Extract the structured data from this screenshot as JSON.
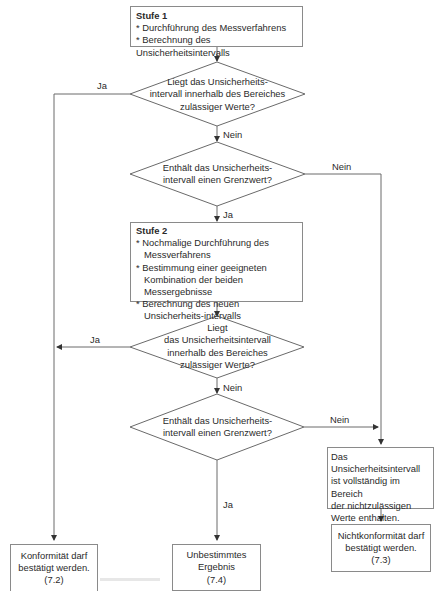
{
  "flowchart": {
    "stufe1": {
      "title": "Stufe 1",
      "items": [
        "* Durchführung des Messverfahrens",
        "* Berechnung des Unsicherheitsintervalls"
      ]
    },
    "decision1": {
      "lines": [
        "Liegt das Unsicherheits-",
        "intervall innerhalb des Bereiches",
        "zulässiger Werte?"
      ],
      "yes_label": "Ja",
      "no_label": "Nein"
    },
    "decision2": {
      "lines": [
        "Enthält das Unsicherheits-",
        "intervall einen Grenzwert?"
      ],
      "yes_label": "Ja",
      "no_label": "Nein"
    },
    "stufe2": {
      "title": "Stufe 2",
      "items": [
        "* Nochmalige Durchführung des Messverfahrens",
        "* Bestimmung einer geeigneten Kombination der beiden Messergebnisse",
        "* Berechnung des neuen Unsicherheits-intervalls"
      ]
    },
    "decision3": {
      "lines": [
        "Liegt",
        "das Unsicherheitsintervall",
        "innerhalb des Bereiches",
        "zulässiger Werte?"
      ],
      "yes_label": "Ja",
      "no_label": "Nein"
    },
    "decision4": {
      "lines": [
        "Enthält das Unsicherheits-",
        "intervall einen Grenzwert?"
      ],
      "yes_label": "Ja",
      "no_label": "Nein"
    },
    "nonconform_box": {
      "lines": [
        "Das Unsicherheitsintervall",
        "ist vollständig im Bereich",
        "der nichtzulässigen",
        "Werte enthalten."
      ]
    },
    "outcomes": [
      {
        "lines": [
          "Konformität darf",
          "bestätigt werden.",
          "(7.2)"
        ]
      },
      {
        "lines": [
          "Unbestimmtes",
          "Ergebnis",
          "(7.4)"
        ]
      },
      {
        "lines": [
          "Nichtkonformität darf",
          "bestätigt werden.",
          "(7.3)"
        ]
      }
    ]
  },
  "colors": {
    "line": "#6a6a6a",
    "border": "#8a8a8a",
    "text": "#2a2a2a"
  }
}
